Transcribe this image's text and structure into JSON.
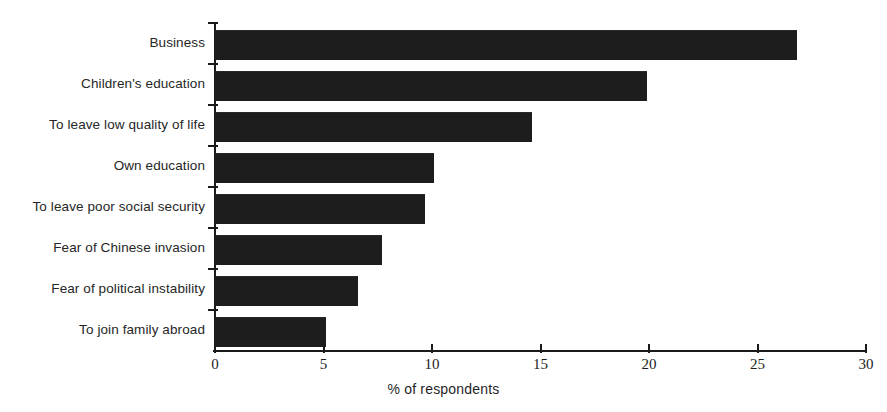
{
  "chart_data": {
    "type": "bar",
    "orientation": "horizontal",
    "title": "",
    "xlabel": "% of respondents",
    "ylabel": "",
    "xlim": [
      0,
      30
    ],
    "xticks": [
      0,
      5,
      10,
      15,
      20,
      25,
      30
    ],
    "xtick_labels": [
      "0",
      "5",
      "10",
      "15",
      "20",
      "25",
      "30"
    ],
    "grid": false,
    "legend": false,
    "categories": [
      "Business",
      "Children's education",
      "To leave low quality of life",
      "Own education",
      "To leave poor social security",
      "Fear of Chinese invasion",
      "Fear of political instability",
      "To join family abroad"
    ],
    "values": [
      26.8,
      19.9,
      14.6,
      10.1,
      9.7,
      7.7,
      6.6,
      5.1
    ],
    "bar_color": "#1d1d1d",
    "axis_color": "#1a1a1a",
    "background_color": "#ffffff"
  },
  "axis": {
    "x_title": "% of respondents"
  },
  "title_remnant": {
    "text": "·"
  }
}
